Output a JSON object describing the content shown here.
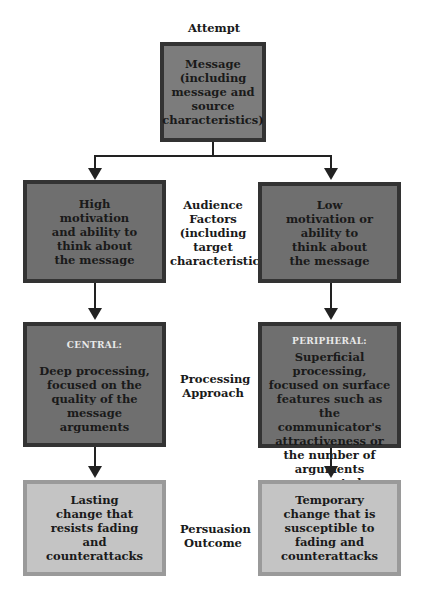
{
  "title": "Attempt",
  "top_box": {
    "text": "Message (including message and source characteristics)"
  },
  "row_labels": {
    "audience": "Audience Factors (including target characteristics)",
    "processing": "Processing Approach",
    "outcome": "Persuasion Outcome"
  },
  "left_column": {
    "audience_box": "High motivation and ability to think about the message",
    "processing_tag": "CENTRAL:",
    "processing_box": "Deep processing, focused on the quality of the message arguments",
    "outcome_box": "Lasting change that resists fading and counterattacks"
  },
  "right_column": {
    "audience_box": "Low motivation or ability to think about the message",
    "processing_tag": "PERIPHERAL:",
    "processing_box": "Superficial processing, focused on surface features such as the communicator's attractiveness or the number of arguments presented",
    "outcome_box": "Temporary change that is susceptible to fading and counterattacks"
  },
  "colors": {
    "dark_box": "#6f6f6f",
    "box_border": "#333333",
    "light_box": "#c4c4c4",
    "light_border": "#9a9a9a",
    "line": "#222222"
  }
}
